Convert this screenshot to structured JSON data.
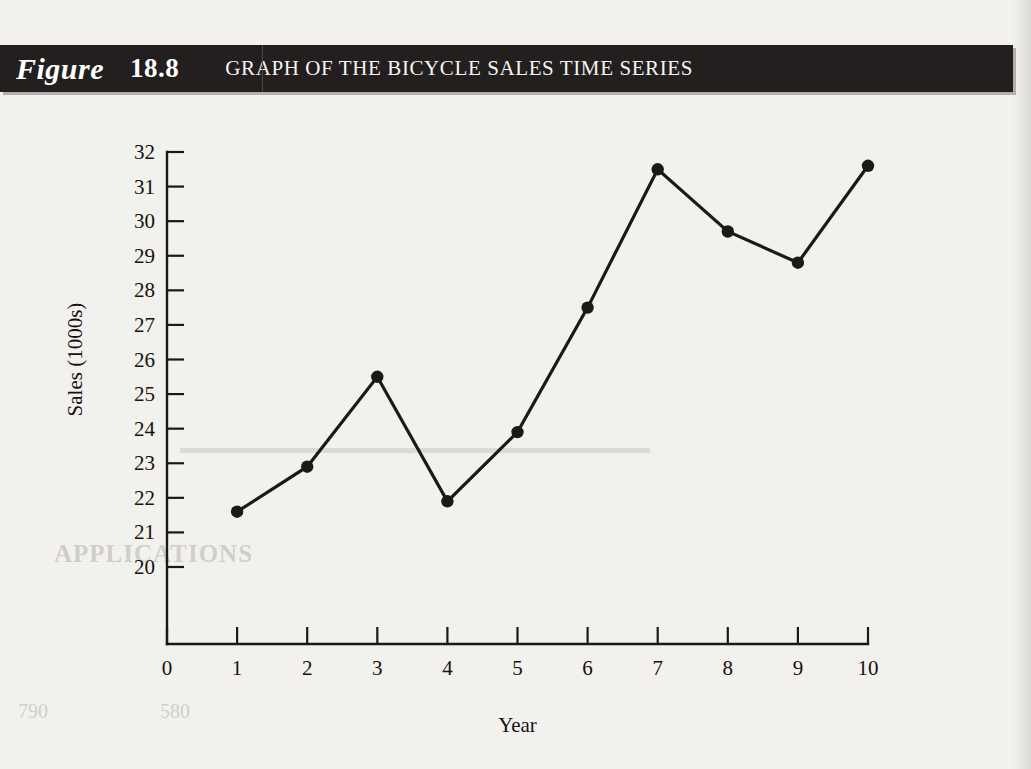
{
  "figure": {
    "label": "Figure",
    "number": "18.8",
    "title": "GRAPH OF THE BICYCLE SALES TIME SERIES"
  },
  "colors": {
    "band_background": "#221f1e",
    "band_text": "#ffffff",
    "page_background": "#f2f1ee",
    "ink": "#1b1917"
  },
  "ghost_text": {
    "applications": "APPLICATIONS",
    "folio_left": "790",
    "folio_mid": "580"
  },
  "chart_data": {
    "type": "line",
    "title": "GRAPH OF THE BICYCLE SALES TIME SERIES",
    "xlabel": "Year",
    "ylabel": "Sales (1000s)",
    "x": [
      1,
      2,
      3,
      4,
      5,
      6,
      7,
      8,
      9,
      10
    ],
    "values": [
      21.6,
      22.9,
      25.5,
      21.9,
      23.9,
      27.5,
      31.5,
      29.7,
      28.8,
      31.6
    ],
    "xticks": [
      "0",
      "1",
      "2",
      "3",
      "4",
      "5",
      "6",
      "7",
      "8",
      "9",
      "10"
    ],
    "xtick_values": [
      0,
      1,
      2,
      3,
      4,
      5,
      6,
      7,
      8,
      9,
      10
    ],
    "yticks": [
      "20",
      "21",
      "22",
      "23",
      "24",
      "25",
      "26",
      "27",
      "28",
      "29",
      "30",
      "31",
      "32"
    ],
    "ytick_values": [
      20,
      21,
      22,
      23,
      24,
      25,
      26,
      27,
      28,
      29,
      30,
      31,
      32
    ],
    "xlim": [
      0,
      10
    ],
    "ylim": [
      18.6,
      32
    ],
    "grid": false,
    "legend": null,
    "marker": "filled-circle",
    "series_color": "#1b1917"
  }
}
